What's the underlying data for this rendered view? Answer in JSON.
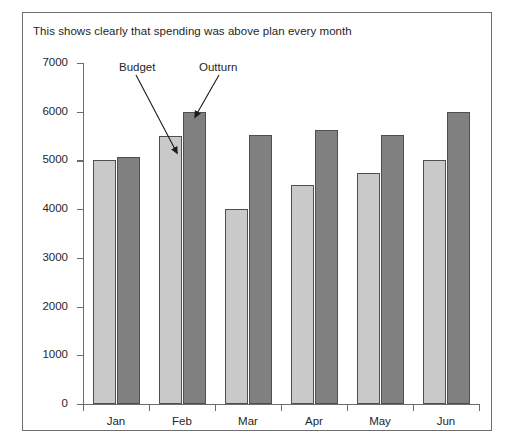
{
  "figure": {
    "caption": "This shows clearly that spending was above plan every month",
    "top_bleed_text": "",
    "frame_color": "#6d6d6d"
  },
  "annotations": [
    {
      "name": "budget",
      "label": "Budget",
      "points_to": "Feb budget bar top"
    },
    {
      "name": "outturn",
      "label": "Outturn",
      "points_to": "Feb outturn bar top"
    }
  ],
  "chart_data": {
    "type": "bar",
    "title": "This shows clearly that spending was above plan every month",
    "xlabel": "",
    "ylabel": "",
    "categories": [
      "Jan",
      "Feb",
      "Mar",
      "Apr",
      "May",
      "Jun"
    ],
    "series": [
      {
        "name": "Budget",
        "color": "#c9c9c9",
        "values": [
          5000,
          5500,
          4000,
          4500,
          4750,
          5000
        ]
      },
      {
        "name": "Outturn",
        "color": "#808080",
        "values": [
          5070,
          6000,
          5520,
          5620,
          5520,
          6000
        ]
      }
    ],
    "ylim": [
      0,
      7000
    ],
    "yticks": [
      0,
      1000,
      2000,
      3000,
      4000,
      5000,
      6000,
      7000
    ],
    "ytick_labels": [
      "0",
      "1000",
      "2000",
      "3000",
      "4000",
      "5000",
      "6000",
      "7000"
    ],
    "grid": false,
    "legend": "none (series identified by pointer annotations)",
    "annotations": [
      {
        "text": "Budget",
        "target_series": "Budget",
        "target_category": "Feb"
      },
      {
        "text": "Outturn",
        "target_series": "Outturn",
        "target_category": "Feb"
      }
    ]
  }
}
